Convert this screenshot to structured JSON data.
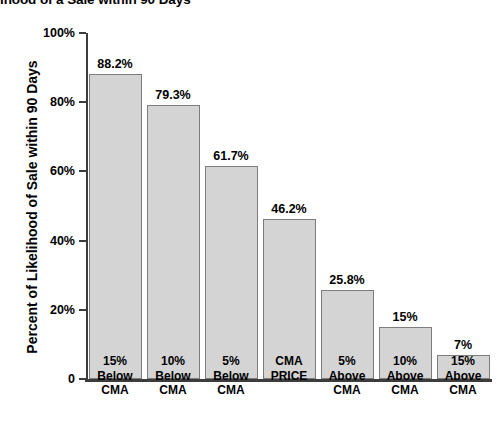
{
  "chart_data": {
    "type": "bar",
    "title": "ihood of a Sale within 90 Days",
    "xlabel": "",
    "ylabel": "Percent of Likelihood of Sale within 90 Days",
    "ylim": [
      0,
      100
    ],
    "grid": false,
    "legend": "none",
    "ytick_labels": [
      "100%",
      "80%",
      "60%",
      "40%",
      "20%",
      "0"
    ],
    "ytick_values": [
      100,
      80,
      60,
      40,
      20,
      0
    ],
    "categories": [
      "15% Below CMA",
      "10% Below CMA",
      "5% Below CMA",
      "CMA PRICE",
      "5% Above CMA",
      "10% Above CMA",
      "15% Above CMA"
    ],
    "category_lines": [
      [
        "15%",
        "Below",
        "CMA"
      ],
      [
        "10%",
        "Below",
        "CMA"
      ],
      [
        "5%",
        "Below",
        "CMA"
      ],
      [
        "CMA",
        "PRICE"
      ],
      [
        "5%",
        "Above",
        "CMA"
      ],
      [
        "10%",
        "Above",
        "CMA"
      ],
      [
        "15%",
        "Above",
        "CMA"
      ]
    ],
    "values": [
      88.2,
      79.3,
      61.7,
      46.2,
      25.8,
      15,
      7
    ],
    "value_labels": [
      "88.2%",
      "79.3%",
      "61.7%",
      "46.2%",
      "25.8%",
      "15%",
      "7%"
    ],
    "bar_fill_color": "#d4d4d4",
    "bar_border_color": "#7d7d7d",
    "axis_color": "#3c3c3c",
    "text_color": "#000000",
    "background_color": "#ffffff"
  }
}
